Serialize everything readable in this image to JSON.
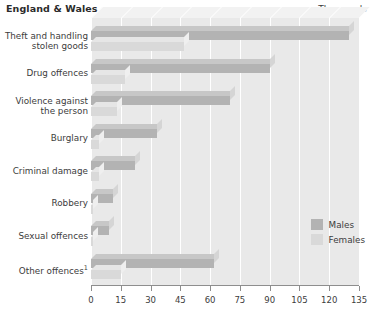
{
  "header": {
    "title": "England & Wales",
    "units": "Thousands"
  },
  "legend": {
    "position": "bottom-right",
    "items": [
      {
        "label": "Males",
        "color": "#b3b3b3",
        "key": "males"
      },
      {
        "label": "Females",
        "color": "#d9d9d9",
        "key": "females"
      }
    ]
  },
  "axis": {
    "ticks": [
      0,
      15,
      30,
      45,
      60,
      75,
      90,
      105,
      120,
      135
    ],
    "min": 0,
    "max": 135
  },
  "chart_data": {
    "type": "bar",
    "orientation": "horizontal",
    "title": "England & Wales",
    "subtitle": "",
    "xlabel": "Thousands",
    "ylabel": "",
    "xlim": [
      0,
      135
    ],
    "grid": true,
    "legend_position": "bottom-right",
    "categories": [
      "Theft and handling stolen goods",
      "Drug offences",
      "Violence against the person",
      "Burglary",
      "Criminal damage",
      "Robbery",
      "Sexual offences",
      "Other offences¹"
    ],
    "category_labels": [
      [
        "Theft and handling",
        "stolen goods"
      ],
      [
        "Drug offences"
      ],
      [
        "Violence against",
        "the person"
      ],
      [
        "Burglary"
      ],
      [
        "Criminal damage"
      ],
      [
        "Robbery"
      ],
      [
        "Sexual offences"
      ],
      [
        "Other offences¹"
      ]
    ],
    "series": [
      {
        "name": "Males",
        "values": [
          130,
          90,
          70,
          33,
          22,
          11,
          9,
          62
        ]
      },
      {
        "name": "Females",
        "values": [
          47,
          17,
          13,
          4,
          4,
          1,
          1,
          15
        ]
      }
    ]
  }
}
